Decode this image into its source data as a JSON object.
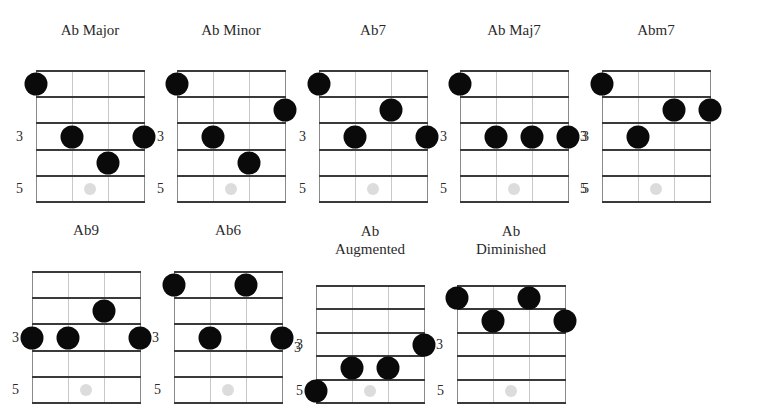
{
  "diagram": {
    "type": "guitar-chord-chart",
    "root": "Ab",
    "strings_shown": 4,
    "frets_shown": 5,
    "fret_labels": [
      "3",
      "5"
    ],
    "colors": {
      "background": "#ffffff",
      "finger_dot": "#0a0a0a",
      "fret_marker": "#dcdcdc",
      "fret_line": "#3a3a3a",
      "string_line": "#c8c8c8",
      "text": "#2a2a2a"
    }
  },
  "chords": [
    {
      "id": "ab-major",
      "title_lines": [
        "Ab Major"
      ],
      "grid": {
        "x": 36,
        "y": 71,
        "w": 108,
        "h": 131
      },
      "title_y": 21,
      "fingers": [
        [
          1,
          1
        ],
        [
          2,
          3
        ],
        [
          4,
          3
        ],
        [
          3,
          4
        ]
      ],
      "labels": [
        {
          "text": "3",
          "side": "left",
          "fret": 3
        },
        {
          "text": "5",
          "side": "left",
          "fret": 5
        }
      ]
    },
    {
      "id": "ab-minor",
      "title_lines": [
        "Ab Minor"
      ],
      "grid": {
        "x": 177,
        "y": 71,
        "w": 108,
        "h": 131
      },
      "title_y": 21,
      "fingers": [
        [
          1,
          1
        ],
        [
          4,
          2
        ],
        [
          2,
          3
        ],
        [
          3,
          4
        ]
      ],
      "labels": [
        {
          "text": "3",
          "side": "left",
          "fret": 3
        },
        {
          "text": "5",
          "side": "left",
          "fret": 5
        }
      ]
    },
    {
      "id": "ab7",
      "title_lines": [
        "Ab7"
      ],
      "grid": {
        "x": 319,
        "y": 71,
        "w": 108,
        "h": 131
      },
      "title_y": 21,
      "fingers": [
        [
          1,
          1
        ],
        [
          3,
          2
        ],
        [
          2,
          3
        ],
        [
          4,
          3
        ]
      ],
      "labels": [
        {
          "text": "3",
          "side": "left",
          "fret": 3
        },
        {
          "text": "5",
          "side": "left",
          "fret": 5
        }
      ]
    },
    {
      "id": "ab-maj7",
      "title_lines": [
        "Ab Maj7"
      ],
      "grid": {
        "x": 460,
        "y": 71,
        "w": 108,
        "h": 131
      },
      "title_y": 21,
      "fingers": [
        [
          1,
          1
        ],
        [
          2,
          3
        ],
        [
          3,
          3
        ],
        [
          4,
          3
        ]
      ],
      "labels": [
        {
          "text": "3",
          "side": "left",
          "fret": 3
        },
        {
          "text": "5",
          "side": "left",
          "fret": 5
        },
        {
          "text": "3",
          "side": "right",
          "fret": 3
        },
        {
          "text": "5",
          "side": "right",
          "fret": 5
        }
      ]
    },
    {
      "id": "abm7",
      "title_lines": [
        "Abm7"
      ],
      "grid": {
        "x": 602,
        "y": 71,
        "w": 108,
        "h": 131
      },
      "title_y": 21,
      "fingers": [
        [
          1,
          1
        ],
        [
          3,
          2
        ],
        [
          4,
          2
        ],
        [
          2,
          3
        ]
      ],
      "labels": [
        {
          "text": "3",
          "side": "left",
          "fret": 3
        },
        {
          "text": "5",
          "side": "left",
          "fret": 5
        }
      ]
    },
    {
      "id": "ab9",
      "title_lines": [
        "Ab9"
      ],
      "grid": {
        "x": 32,
        "y": 272,
        "w": 108,
        "h": 131
      },
      "title_y": 221,
      "fingers": [
        [
          3,
          2
        ],
        [
          1,
          3
        ],
        [
          2,
          3
        ],
        [
          4,
          3
        ]
      ],
      "labels": [
        {
          "text": "3",
          "side": "left",
          "fret": 3
        },
        {
          "text": "5",
          "side": "left",
          "fret": 5
        },
        {
          "text": "3",
          "side": "right",
          "fret": 3
        }
      ]
    },
    {
      "id": "ab6",
      "title_lines": [
        "Ab6"
      ],
      "grid": {
        "x": 174,
        "y": 272,
        "w": 108,
        "h": 131
      },
      "title_y": 221,
      "fingers": [
        [
          1,
          1
        ],
        [
          3,
          1
        ],
        [
          2,
          3
        ],
        [
          4,
          3
        ]
      ],
      "labels": [
        {
          "text": "5",
          "side": "left",
          "fret": 5
        },
        {
          "text": "3",
          "side": "right",
          "fret": 3.4
        }
      ]
    },
    {
      "id": "ab-augmented",
      "title_lines": [
        "Ab",
        "Augmented"
      ],
      "grid": {
        "x": 316,
        "y": 286,
        "w": 108,
        "h": 117
      },
      "title_y": 222,
      "fingers": [
        [
          4,
          3
        ],
        [
          2,
          4
        ],
        [
          3,
          4
        ],
        [
          1,
          5
        ]
      ],
      "labels": [
        {
          "text": "3",
          "side": "left",
          "fret": 3
        },
        {
          "text": "5",
          "side": "left",
          "fret": 5
        },
        {
          "text": "3",
          "side": "right",
          "fret": 3
        }
      ]
    },
    {
      "id": "ab-diminished",
      "title_lines": [
        "Ab",
        "Diminished"
      ],
      "grid": {
        "x": 457,
        "y": 286,
        "w": 108,
        "h": 117
      },
      "title_y": 222,
      "fingers": [
        [
          1,
          1
        ],
        [
          3,
          1
        ],
        [
          2,
          2
        ],
        [
          4,
          2
        ]
      ],
      "labels": [
        {
          "text": "5",
          "side": "left",
          "fret": 5
        }
      ]
    }
  ]
}
